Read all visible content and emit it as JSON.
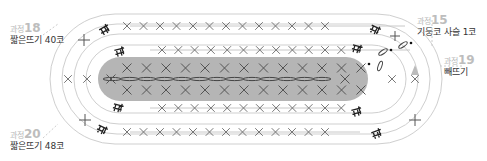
{
  "labels": {
    "step18": {
      "prefix": "과정",
      "num": "18",
      "desc": "짧은뜨기 40코"
    },
    "step20": {
      "prefix": "과정",
      "num": "20",
      "desc": "짧은뜨기 48코"
    },
    "step15": {
      "prefix": "과정",
      "num": "15",
      "desc": "기둥코 사슬 1코"
    },
    "step19": {
      "prefix": "과정",
      "num": "19",
      "desc": "빼뜨기"
    }
  },
  "colors": {
    "center_fill": "#b3b3b3",
    "ring_line": "#c8c8c8",
    "stitch": "#555555",
    "symbol": "#222222",
    "leader": "#d0d0d0"
  },
  "stitch_symbols": {
    "single_crochet": "x",
    "increase": "ㅟ-like double-sc",
    "chain": "oval",
    "slip_stitch": "dot"
  },
  "rows": {
    "center_top_count": 13,
    "center_bottom_count": 13,
    "row1_top_count": 12,
    "row1_bottom_count": 12,
    "row2_top_count": 13,
    "row2_bottom_count": 13
  }
}
